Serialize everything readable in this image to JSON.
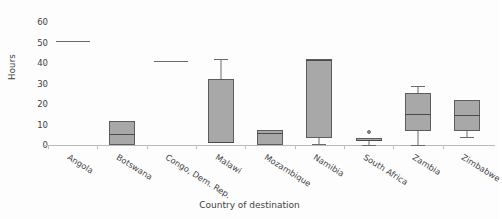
{
  "chart_data": {
    "type": "box",
    "title": "",
    "xlabel": "Country of destination",
    "ylabel": "Hours",
    "ylim": [
      0,
      62
    ],
    "yticks": [
      0,
      10,
      20,
      30,
      40,
      50,
      60
    ],
    "ytick_labels": [
      "0",
      "10",
      "20",
      "30",
      "40",
      "50",
      "60"
    ],
    "grid": false,
    "legend": "none",
    "categories": [
      "Angola",
      "Botswana",
      "Congo, Dem. Rep.",
      "Malawi",
      "Mozambique",
      "Namibia",
      "South Africa",
      "Zambia",
      "Zimbabwe"
    ],
    "boxes": [
      {
        "category": "Angola",
        "single_value": 51,
        "q1": 51,
        "median": 51,
        "q3": 51,
        "whisker_low": 51,
        "whisker_high": 51,
        "outliers": []
      },
      {
        "category": "Botswana",
        "q1": 0,
        "median": 5.5,
        "q3": 11.5,
        "whisker_low": 0,
        "whisker_high": 11.5,
        "outliers": []
      },
      {
        "category": "Congo, Dem. Rep.",
        "single_value": 41,
        "q1": 41,
        "median": 41,
        "q3": 41,
        "whisker_low": 41,
        "whisker_high": 41,
        "outliers": []
      },
      {
        "category": "Malawi",
        "q1": 1,
        "median": 1.5,
        "q3": 32,
        "whisker_low": 1,
        "whisker_high": 42,
        "outliers": []
      },
      {
        "category": "Mozambique",
        "q1": 0,
        "median": 6,
        "q3": 7.5,
        "whisker_low": 0,
        "whisker_high": 7.5,
        "outliers": []
      },
      {
        "category": "Namibia",
        "q1": 3.5,
        "median": 41.5,
        "q3": 42,
        "whisker_low": 0.5,
        "whisker_high": 42,
        "outliers": []
      },
      {
        "category": "South Africa",
        "q1": 2,
        "median": 2.3,
        "q3": 3.3,
        "whisker_low": 0,
        "whisker_high": 3.3,
        "outliers": [
          6.3
        ]
      },
      {
        "category": "Zambia",
        "q1": 7,
        "median": 15,
        "q3": 25.5,
        "whisker_low": 0,
        "whisker_high": 29,
        "outliers": []
      },
      {
        "category": "Zimbabwe",
        "q1": 7,
        "median": 14.5,
        "q3": 22,
        "whisker_low": 4,
        "whisker_high": 22,
        "outliers": []
      }
    ]
  }
}
